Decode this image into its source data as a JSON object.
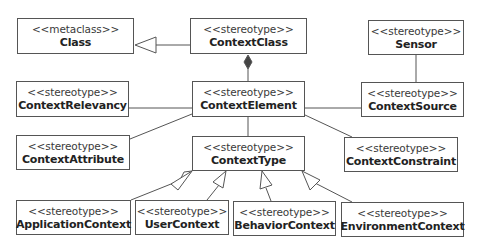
{
  "diagram": {
    "type": "uml-class-diagram",
    "classes": [
      {
        "id": "class",
        "stereotype": "<<metaclass>>",
        "name": "Class",
        "x": 17,
        "y": 18,
        "w": 117,
        "h": 36
      },
      {
        "id": "context-class",
        "stereotype": "<<stereotype>>",
        "name": "ContextClass",
        "x": 190,
        "y": 18,
        "w": 117,
        "h": 36
      },
      {
        "id": "sensor",
        "stereotype": "<<stereotype>>",
        "name": "Sensor",
        "x": 368,
        "y": 20,
        "w": 96,
        "h": 35
      },
      {
        "id": "context-relevancy",
        "stereotype": "<<stereotype>>",
        "name": "ContextRelevancy",
        "x": 16,
        "y": 81,
        "w": 113,
        "h": 36
      },
      {
        "id": "context-element",
        "stereotype": "<<stereotype>>",
        "name": "ContextElement",
        "x": 192,
        "y": 81,
        "w": 113,
        "h": 36
      },
      {
        "id": "context-source",
        "stereotype": "<<stereotype>>",
        "name": "ContextSource",
        "x": 361,
        "y": 82,
        "w": 103,
        "h": 35
      },
      {
        "id": "context-attribute",
        "stereotype": "<<stereotype>>",
        "name": "ContextAttribute",
        "x": 16,
        "y": 135,
        "w": 114,
        "h": 35
      },
      {
        "id": "context-type",
        "stereotype": "<<stereotype>>",
        "name": "ContextType",
        "x": 192,
        "y": 136,
        "w": 113,
        "h": 35
      },
      {
        "id": "context-constraint",
        "stereotype": "<<stereotype>>",
        "name": "ContextConstraint",
        "x": 344,
        "y": 137,
        "w": 114,
        "h": 35
      },
      {
        "id": "application-context",
        "stereotype": "<<stereotype>>",
        "name": "ApplicationContext",
        "x": 16,
        "y": 200,
        "w": 115,
        "h": 35
      },
      {
        "id": "user-context",
        "stereotype": "<<stereotype>>",
        "name": "UserContext",
        "x": 135,
        "y": 200,
        "w": 94,
        "h": 35
      },
      {
        "id": "behavior-context",
        "stereotype": "<<stereotype>>",
        "name": "BehaviorContext",
        "x": 233,
        "y": 201,
        "w": 103,
        "h": 35
      },
      {
        "id": "environment-context",
        "stereotype": "<<stereotype>>",
        "name": "EnvironmentContext",
        "x": 341,
        "y": 202,
        "w": 123,
        "h": 35
      }
    ],
    "relationships": [
      {
        "type": "generalization",
        "from": "ContextClass",
        "to": "Class"
      },
      {
        "type": "composition",
        "from": "ContextElement",
        "to": "ContextClass"
      },
      {
        "type": "association",
        "from": "Sensor",
        "to": "ContextSource"
      },
      {
        "type": "association",
        "from": "ContextElement",
        "to": "ContextRelevancy"
      },
      {
        "type": "association",
        "from": "ContextElement",
        "to": "ContextSource"
      },
      {
        "type": "association",
        "from": "ContextElement",
        "to": "ContextAttribute"
      },
      {
        "type": "association",
        "from": "ContextElement",
        "to": "ContextType"
      },
      {
        "type": "association",
        "from": "ContextElement",
        "to": "ContextConstraint"
      },
      {
        "type": "generalization",
        "from": "ApplicationContext",
        "to": "ContextType"
      },
      {
        "type": "generalization",
        "from": "UserContext",
        "to": "ContextType"
      },
      {
        "type": "generalization",
        "from": "BehaviorContext",
        "to": "ContextType"
      },
      {
        "type": "generalization",
        "from": "EnvironmentContext",
        "to": "ContextType"
      }
    ]
  },
  "colors": {
    "line": "#555555",
    "background": "#ffffff",
    "text": "#222222"
  }
}
